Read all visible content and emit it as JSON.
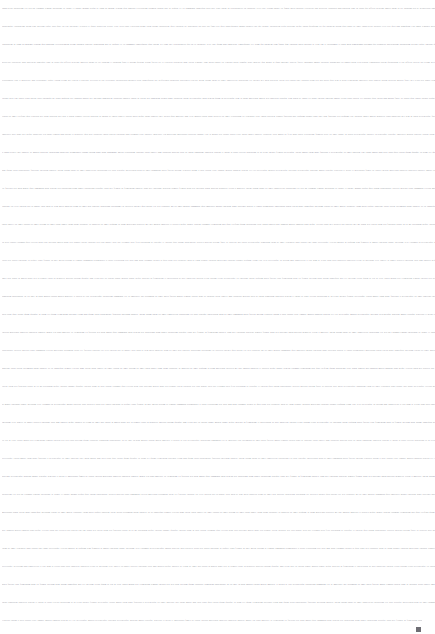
{
  "document": {
    "background_color": "#ffffff",
    "text_color": "#9a9aa2",
    "caret_color": "#6e6e74",
    "zoom_level": "2%",
    "line_height_px": 18,
    "font_size_px": 2.35,
    "line_count": 35,
    "legibility": "illegible-microtext",
    "caret": {
      "glyph": "▃",
      "x": 416,
      "y": 627
    },
    "lines": [
      {
        "id": 1,
        "text": "consectetur adipiscing elit sed do eiusmod tempor incididunt ut labore et dolore magna aliqua ut enim ad minim veniam quis nostrud exercitation ullamco laboris nisi ut aliquip ex ea commodo consequat duis aute irure dolor in reprehenderit in voluptate velit esse cillum dolore eu fugiat nulla pariatur excepteur sint occaecat cupidatat non proident sunt in culpa qui officia deserunt mollit anim id est laborum sed ut perspiciatis unde omnis iste natus error sit voluptatem accusantium"
      },
      {
        "id": 2,
        "text": "doloremque laudantium totam rem aperiam eaque ipsa quae ab illo inventore veritatis et quasi architecto beatae vitae dicta sunt explicabo nemo enim ipsam voluptatem quia voluptas sit aspernatur aut odit aut fugit sed quia consequuntur magni dolores eos qui ratione voluptatem sequi nesciunt neque porro quisquam est qui dolorem ipsum quia dolor sit amet consectetur adipisci velit sed quia non numquam eius modi tempora incidunt ut labore et dolore magnam aliquam quaerat"
      },
      {
        "id": 3,
        "text": "voluptatem ut enim ad minima veniam quis nostrum exercitationem ullam corporis suscipit laboriosam nisi ut aliquid ex ea commodi consequatur quis autem vel eum iure reprehenderit qui in ea voluptate velit esse quam nihil molestiae consequatur vel illum qui dolorem eum fugiat quo voluptas nulla pariatur at vero eos et accusamus et iusto odio dignissimos ducimus qui blanditiis praesentium voluptatum deleniti atque corrupti quos dolores et quas molestias excepturi sint"
      },
      {
        "id": 4,
        "text": "occaecati cupiditate non provident similique sunt in culpa qui officia deserunt mollitia animi id est laborum et dolorum fuga et harum quidem rerum facilis est et expedita distinctio nam libero tempore cum soluta nobis est eligendi optio cumque nihil impedit quo minus id quod maxime placeat facere possimus omnis voluptas assumenda est omnis dolor repellendus temporibus autem quibusdam et aut officiis debitis aut rerum necessitatibus saepe eveniet ut et voluptates"
      },
      {
        "id": 5,
        "text": "repudiandae sint et molestiae non recusandae itaque earum rerum hic tenetur a sapiente delectus ut aut reiciendis voluptatibus maiores alias consequatur aut perferendis doloribus asperiores repellat lorem ipsum dolor sit amet consectetur adipiscing elit integer nec odio praesent libero sed cursus ante dapibus diam sed nisi nulla quis sem at nibh elementum imperdiet duis sagittis ipsum praesent mauris fusce nec tellus sed augue semper porta mauris massa vestibulum"
      },
      {
        "id": 6,
        "text": "lacinia arcu eget nulla class aptent taciti sociosqu ad litora torquent per conubia nostra per inceptos himenaeos curabitur sodales ligula in libero sed dignissim lacinia nunc curabitur tortor pellentesque nibh aenean quam in scelerisque sem at dolor maecenas mattis sed convallis tristique sem proin ut ligula vel nunc egestas porttitor morbi lectus risus iaculis vel suscipit quis luctus non massa fusce ac turpis quis ligula lacinia aliquet mauris ipsum lorem"
      },
      {
        "id": 7,
        "text": "varius sit amet eleifend quis vehicula nec nibh praesent nec nisl a purus blandit viverra praesent ac massa at ligula laoreet iaculis nulla neque dolor sagittis eget iaculis quis molestie non velit mauris turpis nibh ultricies sit amet vestibulum eu venenatis vitae ligula praesent blandit faucibus nisi aliquam blandit urna eget sem faucibus sed aliquam erat volutpat donec mollis hendrerit risus phasellus nec sem in justo pellentesque facilisis etiam imperdiet"
      },
      {
        "id": 8,
        "text": "imperdiet orci nunc nec neque phasellus leo dolor tempus non auctor et hendrerit quis nisi curabitur ligula sapien tincidunt non euismod vitae posuere imperdiet leo maecenas malesuada praesent congue erat at massa sed cursus turpis vitae tortor donec posuere vulputate arcu morbi ac felis nunc nulla vestibulum fringilla pede sit amet augue in turpis pellentesque posuere pellentesque tristique imperdiet mauris suscipit cursus diam integer ante arcu accumsan"
      },
      {
        "id": 9,
        "text": "a consectetuer eget posuere ut mauris praesent adipiscing phasellus ullamcorper ipsum rutrum nunc nunc nonummy metus vestibulum volutpat lacus laoreet non curabitur gravida arcu ac tortor dignissim convallis aenean et tortor at risus viverra adipiscing at in tellus integer feugiat scelerisque varius morbi enim nunc faucibus a pellentesque sit amet porttitor eget dolor morbi non arcu risus quis varius quam quisque id diam vel quam elementum pulvinar etiam"
      },
      {
        "id": 10,
        "text": "non quam lacus suspendisse faucibus interdum posuere lorem ipsum dolor sit amet consectetur adipiscing elit duis tristique sollicitudin nibh sit amet commodo nulla facilisi nullam vehicula ipsum a arcu cursus vitae congue mauris rhoncus aenean vel elit scelerisque mauris pellentesque pulvinar pellentesque habitant morbi tristique senectus et netus et malesuada fames ac turpis egestas maecenas pharetra convallis posuere morbi leo urna molestie at elementum"
      },
      {
        "id": 11,
        "text": "eu facilisis sed odio morbi quis commodo odio aenean sed adipiscing diam donec adipiscing tristique risus nec feugiat in fermentum posuere urna nec tincidunt praesent semper feugiat nibh sed pulvinar proin gravida hendrerit lectus a molestie lorem ipsum dolor sit amet consectetur adipiscing elit sed do eiusmod tempor incididunt ut labore et dolore magna aliqua quis ipsum suspendisse ultrices gravida risus commodo viverra maecenas accumsan lacus vel facilisis"
      },
      {
        "id": 12,
        "text": "volutpat est velit egestas dui id ornare arcu odio ut sem nulla pharetra diam sit amet nisl suscipit adipiscing bibendum est ultricies integer quis auctor elit sed vulputate mi sit amet mauris commodo quis imperdiet massa tincidunt nunc pulvinar sapien et ligula ullamcorper malesuada proin libero nunc consequat interdum varius sit amet mattis vulputate enim nulla aliquet porttitor lacus luctus accumsan tortor posuere ac ut consequat semper viverra nam libero"
      },
      {
        "id": 13,
        "text": "justo laoreet sit amet cursus sit amet dictum sit amet justo donec enim diam vulputate ut pharetra sit amet aliquam id diam maecenas ultricies mi eget mauris pharetra et ultrices neque ornare aenean euismod elementum nisi quis eleifend quam adipiscing vitae proin sagittis nisl rhoncus mattis rhoncus urna neque viverra justo nec ultrices dui sapien eget mi proin sed libero enim sed faucibus turpis in eu mi bibendum neque egestas congue quisque egestas diam"
      },
      {
        "id": 14,
        "text": "in arcu cursus euismod quis viverra nibh cras pulvinar mattis nunc sed blandit libero volutpat sed cras ornare arcu dui vivamus arcu felis bibendum ut tristique et egestas quis ipsum suspendisse ultrices gravida dictum fusce ut placerat orci nulla pellentesque dignissim enim sit amet venenatis urna cursus eget nunc scelerisque viverra mauris in aliquam sem fringilla ut morbi tincidunt augue interdum velit euismod in pellentesque massa placerat duis ultricies"
      },
      {
        "id": 15,
        "text": "lacus sed turpis tincidunt id aliquet risus feugiat in ante metus dictum at tempor commodo ullamcorper a lacus vestibulum sed arcu non odio euismod lacinia at quis risus sed vulputate odio ut enim blandit volutpat maecenas volutpat blandit aliquam etiam erat velit scelerisque in dictum non consectetur a erat nam at lectus urna duis convallis convallis tellus id interdum velit laoreet id donec ultrices tincidunt arcu non sodales neque sodales ut etiam sit"
      },
      {
        "id": 16,
        "text": "amet nisl purus in mollis nunc sed id semper risus in hendrerit gravida rutrum quisque non tellus orci ac auctor augue mauris augue neque gravida in fermentum et sollicitudin ac orci phasellus egestas tellus rutrum tellus pellentesque eu tincidunt tortor aliquam nulla facilisi cras fermentum odio eu feugiat pretium nibh ipsum consequat nisl vel pretium lectus quam id leo in vitae turpis massa sed elementum tempus egestas sed sed risus pretium quam vulputate"
      },
      {
        "id": 17,
        "text": "dignissim suspendisse in est ante in nibh mauris cursus mattis molestie a iaculis at erat pellentesque adipiscing commodo elit at imperdiet dui accumsan sit amet nulla facilisi morbi tempus iaculis urna id volutpat lacus laoreet non curabitur gravida arcu ac tortor dignissim convallis aenean et tortor at risus viverra adipiscing at in tellus integer feugiat scelerisque varius morbi enim nunc faucibus a pellentesque sit amet porttitor eget dolor morbi non"
      },
      {
        "id": 18,
        "text": "arcu risus quis varius quam quisque id diam vel quam elementum pulvinar etiam non quam lacus suspendisse faucibus interdum posuere lorem ipsum dolor sit amet consectetur adipiscing elit duis tristique sollicitudin nibh sit amet commodo nulla facilisi nullam vehicula ipsum a arcu cursus vitae congue mauris rhoncus aenean vel elit scelerisque mauris pellentesque pulvinar pellentesque habitant morbi tristique senectus et netus et malesuada fames ac turpis"
      },
      {
        "id": 19,
        "text": "egestas maecenas pharetra convallis posuere morbi leo urna molestie at elementum eu facilisis sed odio morbi quis commodo odio aenean sed adipiscing diam donec adipiscing tristique risus nec feugiat in fermentum posuere urna nec tincidunt praesent semper feugiat nibh sed pulvinar proin gravida hendrerit lectus a molestie lorem ipsum dolor sit amet consectetur adipiscing elit sed do eiusmod tempor incididunt ut labore et dolore magna aliqua quis ipsum"
      },
      {
        "id": 20,
        "text": "suspendisse ultrices gravida risus commodo viverra maecenas accumsan lacus vel facilisis volutpat est velit egestas dui id ornare arcu odio ut sem nulla pharetra diam sit amet nisl suscipit adipiscing bibendum est ultricies integer quis auctor elit sed vulputate mi sit amet mauris commodo quis imperdiet massa tincidunt nunc pulvinar sapien et ligula ullamcorper malesuada proin libero nunc consequat interdum varius sit amet mattis vulputate enim nulla aliquet"
      },
      {
        "id": 21,
        "text": "porttitor lacus luctus accumsan tortor posuere ac ut consequat semper viverra nam libero justo laoreet sit amet cursus sit amet dictum sit amet justo donec enim diam vulputate ut pharetra sit amet aliquam id diam maecenas ultricies mi eget mauris pharetra et ultrices neque ornare aenean euismod elementum nisi quis eleifend quam adipiscing vitae proin sagittis nisl rhoncus mattis rhoncus urna neque viverra justo nec ultrices dui sapien eget mi proin sed"
      },
      {
        "id": 22,
        "text": "libero enim sed faucibus turpis in eu mi bibendum neque egestas congue quisque egestas diam in arcu cursus euismod quis viverra nibh cras pulvinar mattis nunc sed blandit libero volutpat sed cras ornare arcu dui vivamus arcu felis bibendum ut tristique et egestas quis ipsum suspendisse ultrices gravida dictum fusce ut placerat orci nulla pellentesque dignissim enim sit amet venenatis urna cursus eget nunc scelerisque viverra mauris in aliquam sem fringilla"
      },
      {
        "id": 23,
        "text": "ut morbi tincidunt augue interdum velit euismod in pellentesque massa placerat duis ultricies lacus sed turpis tincidunt id aliquet risus feugiat in ante metus dictum at tempor commodo ullamcorper a lacus vestibulum sed arcu non odio euismod lacinia at quis risus sed vulputate odio ut enim blandit volutpat maecenas volutpat blandit aliquam etiam erat velit scelerisque in dictum non consectetur a erat nam at lectus urna duis convallis convallis tellus id"
      },
      {
        "id": 24,
        "text": "interdum velit laoreet id donec ultrices tincidunt arcu non sodales neque sodales ut etiam sit amet nisl purus in mollis nunc sed id semper risus in hendrerit gravida rutrum quisque non tellus orci ac auctor augue mauris augue neque gravida in fermentum et sollicitudin ac orci phasellus egestas tellus rutrum tellus pellentesque eu tincidunt tortor aliquam nulla facilisi cras fermentum odio eu feugiat pretium nibh ipsum consequat nisl vel pretium lectus quam"
      },
      {
        "id": 25,
        "text": "id leo in vitae turpis massa sed elementum tempus egestas sed sed risus pretium quam vulputate dignissim suspendisse in est ante in nibh mauris cursus mattis molestie a iaculis at erat pellentesque adipiscing commodo elit at imperdiet dui accumsan sit amet nulla facilisi morbi tempus iaculis urna id volutpat lacus laoreet non curabitur gravida arcu ac tortor dignissim convallis aenean et tortor at risus viverra adipiscing at in tellus integer feugiat"
      },
      {
        "id": 26,
        "text": "scelerisque varius morbi enim nunc faucibus a pellentesque sit amet porttitor eget dolor morbi non arcu risus quis varius quam quisque id diam vel quam elementum pulvinar etiam non quam lacus suspendisse faucibus interdum posuere lorem ipsum dolor sit amet consectetur adipiscing elit duis tristique sollicitudin nibh sit amet commodo nulla facilisi nullam vehicula ipsum a arcu cursus vitae congue mauris rhoncus aenean vel elit scelerisque mauris pellentesque"
      },
      {
        "id": 27,
        "text": "pulvinar pellentesque habitant morbi tristique senectus et netus et malesuada fames ac turpis egestas maecenas pharetra convallis posuere morbi leo urna molestie at elementum eu facilisis sed odio morbi quis commodo odio aenean sed adipiscing diam donec adipiscing tristique risus nec feugiat in fermentum posuere urna nec tincidunt praesent semper feugiat nibh sed pulvinar proin gravida hendrerit lectus a molestie lorem ipsum dolor sit amet consectetur"
      },
      {
        "id": 28,
        "text": "adipiscing elit sed do eiusmod tempor incididunt ut labore et dolore magna aliqua quis ipsum suspendisse ultrices gravida risus commodo viverra maecenas accumsan lacus vel facilisis volutpat est velit egestas dui id ornare arcu odio ut sem nulla pharetra diam sit amet nisl suscipit adipiscing bibendum est ultricies integer quis auctor elit sed vulputate mi sit amet mauris commodo quis imperdiet massa tincidunt nunc pulvinar sapien et ligula ullamcorper"
      },
      {
        "id": 29,
        "text": "malesuada proin libero nunc consequat interdum varius sit amet mattis vulputate enim nulla aliquet porttitor lacus luctus accumsan tortor posuere ac ut consequat semper viverra nam libero justo laoreet sit amet cursus sit amet dictum sit amet justo donec enim diam vulputate ut pharetra sit amet aliquam id diam maecenas ultricies mi eget mauris pharetra et ultrices neque ornare aenean euismod elementum nisi quis eleifend quam adipiscing vitae proin sagittis"
      },
      {
        "id": 30,
        "text": "nisl rhoncus mattis rhoncus urna neque viverra justo nec ultrices dui sapien eget mi proin sed libero enim sed faucibus turpis in eu mi bibendum neque egestas congue quisque egestas diam in arcu cursus euismod quis viverra nibh cras pulvinar mattis nunc sed blandit libero volutpat sed cras ornare arcu dui vivamus arcu felis bibendum ut tristique et egestas quis ipsum suspendisse ultrices gravida dictum fusce ut placerat orci nulla pellentesque dignissim"
      },
      {
        "id": 31,
        "text": "enim sit amet venenatis urna cursus eget nunc scelerisque viverra mauris in aliquam sem fringilla ut morbi tincidunt augue interdum velit euismod in pellentesque massa placerat duis ultricies lacus sed turpis tincidunt id aliquet risus feugiat in ante metus dictum at tempor commodo ullamcorper a lacus vestibulum sed arcu non odio euismod lacinia at quis risus sed vulputate odio ut enim blandit volutpat maecenas volutpat blandit aliquam etiam erat velit"
      },
      {
        "id": 32,
        "text": "scelerisque in dictum non consectetur a erat nam at lectus urna duis convallis convallis tellus id interdum velit laoreet id donec ultrices tincidunt arcu non sodales neque sodales ut etiam sit amet nisl purus in mollis nunc sed id semper risus in hendrerit gravida rutrum quisque non tellus orci ac auctor augue mauris augue neque gravida in fermentum et sollicitudin ac orci phasellus egestas tellus rutrum tellus pellentesque eu tincidunt tortor aliquam"
      },
      {
        "id": 33,
        "text": "nulla facilisi cras fermentum odio eu feugiat pretium nibh ipsum consequat nisl vel pretium lectus quam id leo in vitae turpis massa sed elementum tempus egestas sed sed risus pretium quam vulputate dignissim suspendisse in est ante in nibh mauris cursus mattis molestie a iaculis at erat pellentesque adipiscing commodo elit at imperdiet dui accumsan sit amet nulla facilisi morbi tempus iaculis urna id volutpat lacus laoreet non curabitur gravida arcu ac"
      },
      {
        "id": 34,
        "text": "tortor dignissim convallis aenean et tortor at risus viverra adipiscing at in tellus integer feugiat scelerisque varius morbi enim nunc faucibus a pellentesque sit amet porttitor eget dolor morbi non arcu risus quis varius quam quisque id diam vel quam elementum pulvinar etiam non quam lacus suspendisse faucibus interdum posuere lorem ipsum dolor sit amet consectetur adipiscing elit duis tristique sollicitudin nibh sit amet commodo nulla facilisi nullam"
      },
      {
        "id": 35,
        "text": "vehicula ipsum a arcu cursus vitae congue mauris rhoncus aenean vel elit scelerisque mauris pellentesque pulvinar pellentesque habitant morbi tristique senectus et netus et malesuada fames ac turpis egestas maecenas pharetra convallis posuere morbi leo urna molestie at elementum eu facilisis sed odio morbi quis commodo odio aenean sed adipiscing diam donec adipiscing tristique risus nec feugiat in fermentum posuere urna nec tincidunt praesent semper"
      }
    ]
  }
}
